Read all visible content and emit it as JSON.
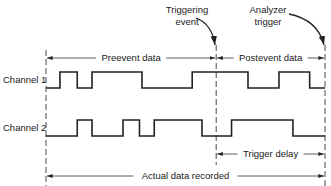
{
  "labels": {
    "triggering_event": [
      "Triggering",
      "event"
    ],
    "analyzer_trigger": [
      "Analyzer",
      "trigger"
    ],
    "preevent": "Preevent data",
    "postevent": "Postevent data",
    "trigger_delay": "Trigger delay",
    "actual_data": "Actual data recorded"
  },
  "channels": [
    {
      "name": "Channel 1",
      "initial": 0,
      "transitions": [
        0.05,
        0.112,
        0.165,
        0.344,
        0.524,
        0.724,
        0.835,
        0.945
      ]
    },
    {
      "name": "Channel 2",
      "initial": 0,
      "transitions": [
        0.112,
        0.165,
        0.276,
        0.335,
        0.388,
        0.559,
        0.665,
        0.885
      ]
    }
  ],
  "markers": {
    "start": 0,
    "triggering_event": 0.61,
    "analyzer_trigger": 1.0
  }
}
